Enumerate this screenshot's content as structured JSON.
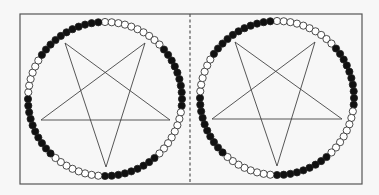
{
  "figure": {
    "width": 379,
    "height": 195,
    "frame": {
      "x": 20,
      "y": 14,
      "width": 342,
      "height": 170,
      "stroke": "#555555"
    },
    "divider": {
      "x": 190,
      "y1": 14,
      "y2": 184,
      "stroke": "#555555",
      "style": "dashed"
    },
    "colors": {
      "background": "#f7f7f7",
      "bead_filled": "#111111",
      "bead_empty": "#ffffff",
      "bead_stroke": "#222222",
      "star_stroke": "#444444"
    }
  },
  "panels": [
    {
      "id": "left",
      "ring": {
        "cx": 105,
        "cy": 99,
        "r": 77,
        "bead_count": 72,
        "bead_radius": 3.6,
        "runs": [
          {
            "fill": "empty",
            "from_deg": 0,
            "to_deg": 45
          },
          {
            "fill": "filled",
            "from_deg": 50,
            "to_deg": 95
          },
          {
            "fill": "empty",
            "from_deg": 100,
            "to_deg": 135
          },
          {
            "fill": "filled",
            "from_deg": 140,
            "to_deg": 180
          },
          {
            "fill": "empty",
            "from_deg": 185,
            "to_deg": 220
          },
          {
            "fill": "filled",
            "from_deg": 225,
            "to_deg": 270
          },
          {
            "fill": "empty",
            "from_deg": 275,
            "to_deg": 300
          },
          {
            "fill": "filled",
            "from_deg": 305,
            "to_deg": 355
          }
        ]
      },
      "pentagram": {
        "orientation": "inverted",
        "vertices": [
          [
            65,
            43
          ],
          [
            106,
            167
          ],
          [
            145,
            43
          ],
          [
            41,
            120
          ],
          [
            170,
            120
          ]
        ]
      }
    },
    {
      "id": "right",
      "ring": {
        "cx": 277,
        "cy": 98,
        "r": 77,
        "bead_count": 72,
        "bead_radius": 3.6,
        "runs": [
          {
            "fill": "empty",
            "from_deg": 0,
            "to_deg": 45
          },
          {
            "fill": "filled",
            "from_deg": 50,
            "to_deg": 95
          },
          {
            "fill": "empty",
            "from_deg": 100,
            "to_deg": 135
          },
          {
            "fill": "filled",
            "from_deg": 140,
            "to_deg": 180
          },
          {
            "fill": "empty",
            "from_deg": 185,
            "to_deg": 220
          },
          {
            "fill": "filled",
            "from_deg": 225,
            "to_deg": 270
          },
          {
            "fill": "empty",
            "from_deg": 275,
            "to_deg": 300
          },
          {
            "fill": "filled",
            "from_deg": 305,
            "to_deg": 355
          }
        ]
      },
      "pentagram": {
        "orientation": "inverted",
        "vertices": [
          [
            235,
            42
          ],
          [
            277,
            166
          ],
          [
            315,
            42
          ],
          [
            212,
            119
          ],
          [
            342,
            119
          ]
        ]
      }
    }
  ]
}
